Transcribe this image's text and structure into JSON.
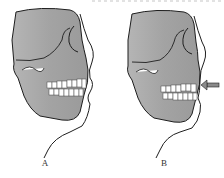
{
  "figure": {
    "type": "medical illustration - lateral skull profile with soft tissue outline",
    "panels": [
      {
        "label": "A",
        "description": "Skull lateral view with normal occlusion and soft-tissue facial profile"
      },
      {
        "label": "B",
        "description": "Skull lateral view with lip profile change; arrow pointing to lip region"
      }
    ],
    "arrow": {
      "panel": "B",
      "direction": "left",
      "target": "upper lip"
    },
    "colors": {
      "bone": "#a9a9a9",
      "bone_light": "#c8c8c8",
      "outline": "#1e1e1e",
      "teeth": "#ffffff",
      "background": "#ffffff"
    }
  }
}
